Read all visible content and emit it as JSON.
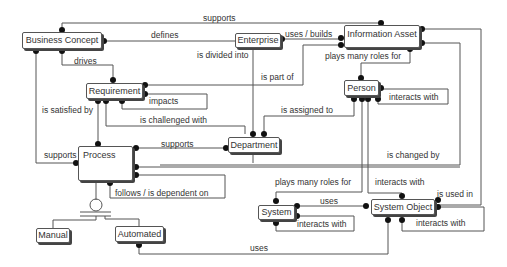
{
  "diagram": {
    "type": "entity-relationship",
    "entities": {
      "business_concept": "Business Concept",
      "enterprise": "Enterprise",
      "information_asset": "Information Asset",
      "requirement": "Requirement",
      "person": "Person",
      "department": "Department",
      "process": "Process",
      "system": "System",
      "system_object": "System Object",
      "manual": "Manual",
      "automated": "Automated"
    },
    "relationships": {
      "supports_top": "supports",
      "defines": "defines",
      "uses_builds": "uses / builds",
      "is_divided_into": "is divided into",
      "drives": "drives",
      "plays_many_roles_for_1": "plays many roles for",
      "is_part_of": "is part of",
      "impacts": "impacts",
      "is_satisfied_by": "is satisfied by",
      "interacts_with_person": "interacts with",
      "is_assigned_to": "is assigned to",
      "is_challenged_with": "is challenged with",
      "supports_process_dept": "supports",
      "supports_left": "supports",
      "is_changed_by": "is changed by",
      "follows_is_dependent_on": "follows / is dependent on",
      "plays_many_roles_for_2": "plays many roles for",
      "interacts_with_so": "interacts with",
      "is_used_in": "is used in",
      "uses_sys_so": "uses",
      "interacts_with_system": "interacts with",
      "interacts_with_so_self": "interacts with",
      "uses_bottom": "uses"
    },
    "edges": [
      {
        "from": "Business Concept",
        "to": "Information Asset",
        "label": "supports"
      },
      {
        "from": "Enterprise",
        "to": "Business Concept",
        "label": "defines"
      },
      {
        "from": "Enterprise",
        "to": "Information Asset",
        "label": "uses / builds"
      },
      {
        "from": "Enterprise",
        "to": "Department",
        "label": "is divided into"
      },
      {
        "from": "Business Concept",
        "to": "Requirement",
        "label": "drives"
      },
      {
        "from": "Information Asset",
        "to": "Person",
        "label": "plays many roles for"
      },
      {
        "from": "Information Asset",
        "to": "Requirement",
        "label": "is part of"
      },
      {
        "from": "Requirement",
        "to": "Requirement",
        "label": "impacts"
      },
      {
        "from": "Requirement",
        "to": "Process",
        "label": "is satisfied by"
      },
      {
        "from": "Person",
        "to": "Person",
        "label": "interacts with"
      },
      {
        "from": "Person",
        "to": "Department",
        "label": "is assigned to"
      },
      {
        "from": "Requirement",
        "to": "Department",
        "label": "is challenged with"
      },
      {
        "from": "Process",
        "to": "Department",
        "label": "supports"
      },
      {
        "from": "Business Concept",
        "to": "Process",
        "label": "supports"
      },
      {
        "from": "Information Asset",
        "to": "Process",
        "label": "is changed by"
      },
      {
        "from": "Process",
        "to": "Process",
        "label": "follows / is dependent on"
      },
      {
        "from": "Person",
        "to": "System",
        "label": "plays many roles for"
      },
      {
        "from": "Person",
        "to": "System Object",
        "label": "interacts with"
      },
      {
        "from": "Information Asset",
        "to": "System Object",
        "label": "is used in"
      },
      {
        "from": "System",
        "to": "System Object",
        "label": "uses"
      },
      {
        "from": "System",
        "to": "System",
        "label": "interacts with"
      },
      {
        "from": "System Object",
        "to": "System Object",
        "label": "interacts with"
      },
      {
        "from": "Automated",
        "to": "System Object",
        "label": "uses"
      },
      {
        "from": "Process",
        "to": "Manual",
        "label": "subtype"
      },
      {
        "from": "Process",
        "to": "Automated",
        "label": "subtype"
      }
    ]
  }
}
